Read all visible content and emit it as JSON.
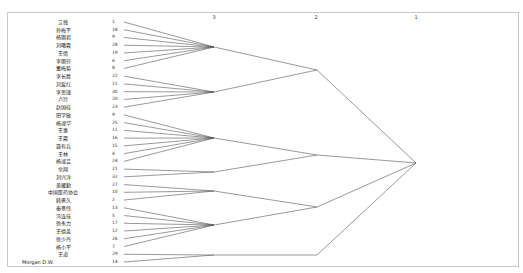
{
  "axis": {
    "ticks": [
      {
        "label": "3",
        "x": 214
      },
      {
        "label": "2",
        "x": 316
      },
      {
        "label": "1",
        "x": 416
      }
    ]
  },
  "leaves": [
    {
      "name": "艾薇",
      "id": "1"
    },
    {
      "name": "孙梅平",
      "id": "18"
    },
    {
      "name": "杨丽君",
      "id": "9"
    },
    {
      "name": "刘曙霞",
      "id": "28"
    },
    {
      "name": "王倩",
      "id": "19"
    },
    {
      "name": "李丽芬",
      "id": "6"
    },
    {
      "name": "董梅菊",
      "id": "8"
    },
    {
      "name": "李长胜",
      "id": "22"
    },
    {
      "name": "刘爱红",
      "id": "11"
    },
    {
      "name": "李思瑾",
      "id": "30"
    },
    {
      "name": "卢玲",
      "id": "20"
    },
    {
      "name": "赵国桂",
      "id": "23"
    },
    {
      "name": "田学敏",
      "id": "9"
    },
    {
      "name": "杨淑华",
      "id": "25"
    },
    {
      "name": "王惠",
      "id": "11"
    },
    {
      "name": "王霞",
      "id": "16"
    },
    {
      "name": "聂有兵",
      "id": "15"
    },
    {
      "name": "王林",
      "id": "4"
    },
    {
      "name": "杨淑芸",
      "id": "24"
    },
    {
      "name": "余翔",
      "id": "21"
    },
    {
      "name": "刘兴洋",
      "id": "32"
    },
    {
      "name": "黄耀勤",
      "id": "27"
    },
    {
      "name": "中国医药协会",
      "id": "10"
    },
    {
      "name": "韩勇久",
      "id": "2"
    },
    {
      "name": "秦景伟",
      "id": "13"
    },
    {
      "name": "冯连佳",
      "id": "5"
    },
    {
      "name": "徐永力",
      "id": "17"
    },
    {
      "name": "王德英",
      "id": "12"
    },
    {
      "name": "徐少丹",
      "id": "26"
    },
    {
      "name": "杨小平",
      "id": "7"
    },
    {
      "name": "王道",
      "id": "29"
    },
    {
      "name": "Morgan D.W.",
      "id": "14"
    }
  ],
  "clusters_level3": [
    {
      "rows": [
        0,
        1,
        2,
        3,
        4,
        5,
        6
      ],
      "x": 214,
      "y": 47
    },
    {
      "rows": [
        7,
        8,
        9,
        10,
        11
      ],
      "x": 214,
      "y": 92
    },
    {
      "rows": [
        12,
        13,
        14,
        15,
        16,
        17,
        18
      ],
      "x": 214,
      "y": 138
    },
    {
      "rows": [
        19,
        20
      ],
      "x": 214,
      "y": 172
    },
    {
      "rows": [
        21,
        22,
        23
      ],
      "x": 214,
      "y": 191
    },
    {
      "rows": [
        24,
        25,
        26,
        27,
        28,
        29
      ],
      "x": 214,
      "y": 225
    },
    {
      "rows": [
        30,
        31
      ],
      "x": 214,
      "y": 255
    }
  ],
  "clusters_level2": [
    {
      "children": [
        0,
        1
      ],
      "x": 317,
      "y": 70
    },
    {
      "children": [
        2,
        3
      ],
      "x": 317,
      "y": 155
    },
    {
      "children": [
        4,
        5
      ],
      "x": 317,
      "y": 207
    },
    {
      "children": [
        6
      ],
      "x": 317,
      "y": 255
    }
  ],
  "root": {
    "x": 416,
    "y": 163
  },
  "colors": {
    "line": "#555555",
    "frame": "#c8c8c8"
  }
}
